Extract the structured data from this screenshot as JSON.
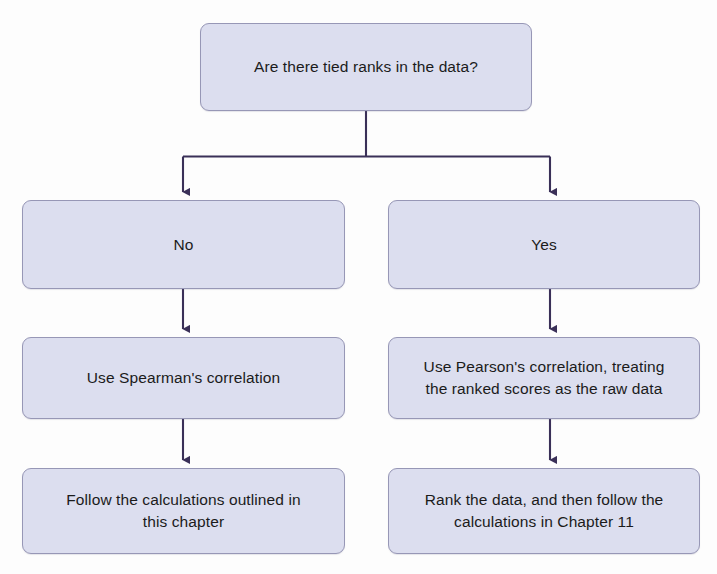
{
  "diagram": {
    "type": "flowchart",
    "colors": {
      "node_fill": "#dcdeef",
      "node_border": "#9797b6",
      "connector": "#3a3058",
      "text": "#1b1b1b",
      "background": "#fdfdfd"
    },
    "nodes": [
      {
        "id": "question",
        "label": "Are there tied ranks in the data?",
        "role": "decision",
        "row": 1
      },
      {
        "id": "branch_no",
        "label": "No",
        "role": "branch-label",
        "row": 2
      },
      {
        "id": "branch_yes",
        "label": "Yes",
        "role": "branch-label",
        "row": 2
      },
      {
        "id": "spearman",
        "label": "Use Spearman's correlation",
        "role": "action",
        "row": 3
      },
      {
        "id": "pearson",
        "label": "Use Pearson's correlation, treating\nthe ranked scores as the raw data",
        "role": "action",
        "row": 3
      },
      {
        "id": "follow_calcs",
        "label": "Follow the calculations outlined in\nthis chapter",
        "role": "action",
        "row": 4
      },
      {
        "id": "rank_data",
        "label": "Rank the data, and then follow the\ncalculations in Chapter 11",
        "role": "action",
        "row": 4
      }
    ],
    "edges": [
      {
        "id": "question-to-no",
        "from": "question",
        "to": "branch_no",
        "arrow": true
      },
      {
        "id": "question-to-yes",
        "from": "question",
        "to": "branch_yes",
        "arrow": true
      },
      {
        "id": "no-to-spearman",
        "from": "branch_no",
        "to": "spearman",
        "arrow": true
      },
      {
        "id": "yes-to-pearson",
        "from": "branch_yes",
        "to": "pearson",
        "arrow": true
      },
      {
        "id": "spearman-to-follow",
        "from": "spearman",
        "to": "follow_calcs",
        "arrow": true
      },
      {
        "id": "pearson-to-rank",
        "from": "pearson",
        "to": "rank_data",
        "arrow": true
      }
    ]
  }
}
